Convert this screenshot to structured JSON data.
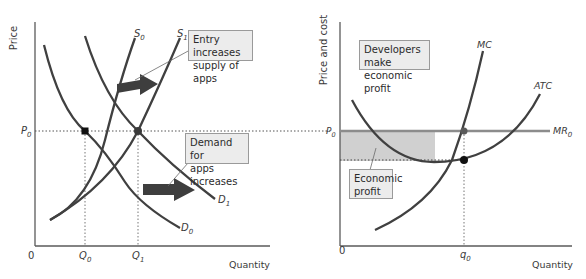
{
  "left_panel": {
    "y_axis_label": "Price",
    "x_axis_label": "Quantity",
    "origin_label": "0",
    "price_label": "P",
    "price_sub": "0",
    "q0_label": "Q",
    "q0_sub": "0",
    "q1_label": "Q",
    "q1_sub": "1",
    "curves": {
      "s0": {
        "label": "S",
        "sub": "0"
      },
      "s1": {
        "label": "S",
        "sub": "1"
      },
      "d0": {
        "label": "D",
        "sub": "0"
      },
      "d1": {
        "label": "D",
        "sub": "1"
      }
    },
    "notes": {
      "supply": {
        "line1": "Entry increases",
        "line2": "supply of apps"
      },
      "demand": {
        "line1": "Demand for",
        "line2": "apps increases"
      }
    }
  },
  "right_panel": {
    "y_axis_label": "Price and cost",
    "x_axis_label": "Quantity",
    "origin_label": "0",
    "price_label": "P",
    "price_sub": "0",
    "q_label": "q",
    "q_sub": "0",
    "curves": {
      "mc": {
        "label": "MC"
      },
      "atc": {
        "label": "ATC"
      },
      "mr": {
        "label": "MR",
        "sub": "0"
      }
    },
    "notes": {
      "profit_title": {
        "line1": "Developers make",
        "line2": "economic profit"
      },
      "profit_area": {
        "line1": "Economic",
        "line2": "profit"
      }
    }
  },
  "colors": {
    "curve": "#404040",
    "axis": "#555555",
    "profit_fill": "#d0d0d0",
    "mr_line": "#8c8c8c",
    "arrow": "#3e3e3e",
    "note_bg": "#ececec"
  }
}
